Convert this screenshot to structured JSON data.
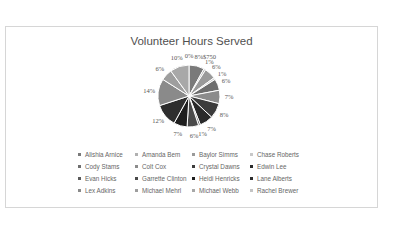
{
  "chart_data": {
    "type": "pie",
    "title": "Volunteer Hours Served",
    "legend_position": "bottom",
    "categories": [
      "Alishia Arnice",
      "Amanda Bem",
      "Baylor Simms",
      "Chase Roberts",
      "Cody Stams",
      "Colt Cox",
      "Crystal Dawns",
      "Edwin Lee",
      "Evan Hicks",
      "Garrette Clinton",
      "Heidi Henricks",
      "Lane Alberts",
      "Lex Adkins",
      "Michael Mehrl",
      "Michael Webb",
      "Rachel Brewer"
    ],
    "values": [
      8,
      1,
      6,
      1,
      6,
      7,
      8,
      7,
      1,
      6,
      7,
      12,
      14,
      6,
      10,
      0
    ],
    "value_unit": "%",
    "colors": [
      "#7a7a7a",
      "#b0b0b0",
      "#9a9a9a",
      "#c8c8c8",
      "#6e6e6e",
      "#8c8c8c",
      "#3c3c3c",
      "#2a2a2a",
      "#5a5a5a",
      "#4a4a4a",
      "#1e1e1e",
      "#868686",
      "#a2a2a2",
      "#8a8a8a",
      "#b8b8b8",
      "#d0d0d0"
    ],
    "data_labels": [
      "8%",
      "1%",
      "6%",
      "1%",
      "6%",
      "7%",
      "8%",
      "7%",
      "1%",
      "6%",
      "7%",
      "12%",
      "14%",
      "6%",
      "10%",
      "0%"
    ],
    "extra_label": "$750"
  },
  "title": "Volunteer Hours Served",
  "legend": [
    {
      "label": "Alishia Arnice",
      "color": "#7a7a7a"
    },
    {
      "label": "Amanda Bem",
      "color": "#b0b0b0"
    },
    {
      "label": "Baylor Simms",
      "color": "#9a9a9a"
    },
    {
      "label": "Chase Roberts",
      "color": "#c8c8c8"
    },
    {
      "label": "Cody Stams",
      "color": "#6e6e6e"
    },
    {
      "label": "Colt Cox",
      "color": "#8c8c8c"
    },
    {
      "label": "Crystal Dawns",
      "color": "#3c3c3c"
    },
    {
      "label": "Edwin Lee",
      "color": "#2a2a2a"
    },
    {
      "label": "Evan Hicks",
      "color": "#5a5a5a"
    },
    {
      "label": "Garrette Clinton",
      "color": "#4a4a4a"
    },
    {
      "label": "Heidi Henricks",
      "color": "#1e1e1e"
    },
    {
      "label": "Lane Alberts",
      "color": "#2e2e2e"
    },
    {
      "label": "Lex Adkins",
      "color": "#8a8a8a"
    },
    {
      "label": "Michael Mehrl",
      "color": "#9e9e9e"
    },
    {
      "label": "Michael Webb",
      "color": "#a8a8a8"
    },
    {
      "label": "Rachel Brewer",
      "color": "#c4c4c4"
    }
  ]
}
